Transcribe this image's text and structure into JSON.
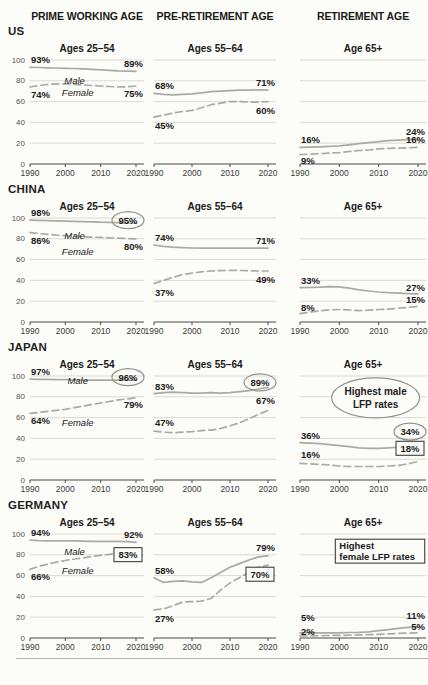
{
  "header": {
    "columns": [
      "PRIME WORKING AGE",
      "PRE-RETIREMENT AGE",
      "RETIREMENT AGE"
    ]
  },
  "rows": [
    {
      "label": "US"
    },
    {
      "label": "CHINA"
    },
    {
      "label": "JAPAN"
    },
    {
      "label": "GERMANY"
    }
  ],
  "axis": {
    "x_ticks": [
      "1990",
      "2000",
      "2010",
      "2020"
    ],
    "x_years": [
      1990,
      2020
    ],
    "y_ticks": [
      "100",
      "80",
      "60",
      "40",
      "20",
      "0"
    ],
    "ylim": [
      0,
      100
    ],
    "grid": true
  },
  "colors": {
    "line": "#a9aca2",
    "grid": "#dbdbd3",
    "axis": "#4a4a44",
    "text": "#1b1b19",
    "tick_text": "#3b3b36",
    "ytick_text": "#55534e",
    "annotation_stroke": "#8f9288",
    "box_stroke": "#2c2c28",
    "background": "#fcfcf9"
  },
  "chart_data": [
    {
      "id": "us-25-54",
      "country": "US",
      "title": "Ages 25–54",
      "type": "line",
      "col": 0,
      "show_y_axis": true,
      "ylim": [
        0,
        100
      ],
      "series": [
        {
          "name": "Male",
          "style": "solid",
          "start_label": "93%",
          "end_label": "89%",
          "start_dy": -4,
          "end_dy": -4,
          "end_decoration": null,
          "name_label": {
            "x": 0.42,
            "dy": 9
          },
          "values": [
            93,
            92.8,
            92.5,
            92.3,
            92,
            91.8,
            91.5,
            91,
            90.5,
            90,
            89.5,
            89.2,
            89
          ]
        },
        {
          "name": "Female",
          "style": "dashed",
          "start_label": "74%",
          "end_label": "75%",
          "start_dy": 11,
          "end_dy": 11,
          "end_decoration": null,
          "name_label": {
            "x": 0.45,
            "dy": 6
          },
          "values": [
            74,
            75.5,
            76.5,
            77,
            77,
            76.5,
            76,
            75.5,
            75,
            74.5,
            74,
            74.3,
            75
          ]
        }
      ],
      "callout": null
    },
    {
      "id": "us-55-64",
      "country": "US",
      "title": "Ages 55–64",
      "type": "line",
      "col": 1,
      "show_y_axis": false,
      "ylim": [
        0,
        100
      ],
      "series": [
        {
          "name": "Male",
          "style": "solid",
          "start_label": "68%",
          "end_label": "71%",
          "start_dy": -4,
          "end_dy": -4,
          "end_decoration": null,
          "name_label": null,
          "values": [
            68,
            67,
            66.5,
            67,
            67.5,
            68.5,
            69.5,
            70,
            70.5,
            71,
            71,
            71.3,
            71
          ]
        },
        {
          "name": "Female",
          "style": "dashed",
          "start_label": "45%",
          "end_label": "60%",
          "start_dy": 12,
          "end_dy": 12,
          "end_decoration": null,
          "name_label": null,
          "values": [
            45,
            47,
            49,
            50.5,
            51.5,
            54,
            57,
            58.5,
            60,
            60,
            59.5,
            59.5,
            60
          ]
        }
      ],
      "callout": null
    },
    {
      "id": "us-65",
      "country": "US",
      "title": "Age 65+",
      "type": "line",
      "col": 2,
      "show_y_axis": false,
      "ylim": [
        0,
        100
      ],
      "series": [
        {
          "name": "Male",
          "style": "solid",
          "start_label": "16%",
          "end_label": "24%",
          "start_dy": -4,
          "end_dy": -4,
          "end_decoration": null,
          "name_label": null,
          "values": [
            16,
            16.2,
            16.5,
            17,
            17.5,
            18.5,
            19.5,
            20.5,
            21.5,
            22.5,
            23,
            23.5,
            24
          ]
        },
        {
          "name": "Female",
          "style": "dashed",
          "start_label": "9%",
          "end_label": "16%",
          "start_dy": 9,
          "end_dy": -4,
          "end_decoration": null,
          "name_label": null,
          "values": [
            9,
            9.5,
            10,
            10.5,
            11,
            12,
            13,
            13.5,
            14.5,
            15,
            15.3,
            15.6,
            16
          ]
        }
      ],
      "callout": null
    },
    {
      "id": "china-25-54",
      "country": "CHINA",
      "title": "Ages 25–54",
      "type": "line",
      "col": 0,
      "show_y_axis": true,
      "ylim": [
        0,
        100
      ],
      "series": [
        {
          "name": "Male",
          "style": "solid",
          "start_label": "98%",
          "end_label": "95%",
          "start_dy": -4,
          "end_dy": -3,
          "end_decoration": "circle",
          "name_label": {
            "x": 0.42,
            "dy": 12
          },
          "values": [
            98,
            97.8,
            97.5,
            97.2,
            97,
            96.8,
            96.5,
            96.3,
            96,
            95.8,
            95.5,
            95.2,
            95
          ]
        },
        {
          "name": "Female",
          "style": "dashed",
          "start_label": "86%",
          "end_label": "80%",
          "start_dy": 11,
          "end_dy": 11,
          "end_decoration": null,
          "name_label": {
            "x": 0.45,
            "dy": 13
          },
          "values": [
            86,
            85,
            84.3,
            83.6,
            83,
            82.5,
            82,
            81.6,
            81.3,
            81,
            80.6,
            80.3,
            80
          ]
        }
      ],
      "callout": null
    },
    {
      "id": "china-55-64",
      "country": "CHINA",
      "title": "Ages 55–64",
      "type": "line",
      "col": 1,
      "show_y_axis": false,
      "ylim": [
        0,
        100
      ],
      "series": [
        {
          "name": "Male",
          "style": "solid",
          "start_label": "74%",
          "end_label": "71%",
          "start_dy": -4,
          "end_dy": -4,
          "end_decoration": null,
          "name_label": null,
          "values": [
            74,
            72.8,
            72,
            71.5,
            71.2,
            71,
            71,
            71,
            71,
            71,
            71,
            71,
            71
          ]
        },
        {
          "name": "Female",
          "style": "dashed",
          "start_label": "37%",
          "end_label": "49%",
          "start_dy": 12,
          "end_dy": 12,
          "end_decoration": null,
          "name_label": null,
          "values": [
            37,
            40,
            43,
            45.5,
            47,
            48.3,
            49,
            49.4,
            49.6,
            49.5,
            49.3,
            49,
            49
          ]
        }
      ],
      "callout": null
    },
    {
      "id": "china-65",
      "country": "CHINA",
      "title": "Age 65+",
      "type": "line",
      "col": 2,
      "show_y_axis": false,
      "ylim": [
        0,
        100
      ],
      "series": [
        {
          "name": "Male",
          "style": "solid",
          "start_label": "33%",
          "end_label": "27%",
          "start_dy": -4,
          "end_dy": -3,
          "end_decoration": null,
          "name_label": null,
          "values": [
            33,
            33.2,
            33.5,
            34,
            33.8,
            32.5,
            31,
            29.8,
            28.8,
            28.2,
            27.8,
            27.3,
            27
          ]
        },
        {
          "name": "Female",
          "style": "dashed",
          "start_label": "8%",
          "end_label": "15%",
          "start_dy": -3,
          "end_dy": -3,
          "end_decoration": null,
          "name_label": null,
          "values": [
            8,
            9.5,
            10.8,
            11.6,
            12,
            11.5,
            11,
            11.3,
            12,
            12.4,
            13.2,
            14,
            15
          ]
        }
      ],
      "callout": null
    },
    {
      "id": "japan-25-54",
      "country": "JAPAN",
      "title": "Ages 25–54",
      "type": "line",
      "col": 0,
      "show_y_axis": true,
      "ylim": [
        0,
        100
      ],
      "series": [
        {
          "name": "Male",
          "style": "solid",
          "start_label": "97%",
          "end_label": "96%",
          "start_dy": -4,
          "end_dy": -3,
          "end_decoration": "circle",
          "name_label": {
            "x": 0.45,
            "dy": -2
          },
          "values": [
            97,
            96.8,
            96.7,
            96.5,
            96.4,
            96.2,
            96.1,
            96,
            96,
            96,
            96,
            96,
            96
          ]
        },
        {
          "name": "Female",
          "style": "dashed",
          "start_label": "64%",
          "end_label": "79%",
          "start_dy": 11,
          "end_dy": 10,
          "end_decoration": null,
          "name_label": {
            "x": 0.45,
            "dy": 12
          },
          "values": [
            64,
            65,
            66,
            67,
            68,
            69.5,
            71,
            72.5,
            74,
            75.5,
            77,
            78,
            79
          ]
        }
      ],
      "callout": null
    },
    {
      "id": "japan-55-64",
      "country": "JAPAN",
      "title": "Ages 55–64",
      "type": "line",
      "col": 1,
      "show_y_axis": false,
      "ylim": [
        0,
        100
      ],
      "series": [
        {
          "name": "Male",
          "style": "solid",
          "start_label": "83%",
          "end_label": "89%",
          "start_dy": -4,
          "end_dy": -5,
          "end_decoration": "circle",
          "name_label": null,
          "values": [
            83,
            84,
            84.5,
            84,
            83.5,
            83.5,
            84,
            83.5,
            84,
            85,
            86,
            87.5,
            89
          ]
        },
        {
          "name": "Female",
          "style": "dashed",
          "start_label": "47%",
          "end_label": "67%",
          "start_dy": -5,
          "end_dy": -6,
          "end_decoration": null,
          "name_label": null,
          "values": [
            47,
            46,
            45.5,
            46,
            46.5,
            47.5,
            48,
            49.5,
            52,
            55,
            59,
            63,
            67
          ]
        }
      ],
      "callout": null
    },
    {
      "id": "japan-65",
      "country": "JAPAN",
      "title": "Age 65+",
      "type": "line",
      "col": 2,
      "show_y_axis": false,
      "ylim": [
        0,
        100
      ],
      "series": [
        {
          "name": "Male",
          "style": "solid",
          "start_label": "36%",
          "end_label": "34%",
          "start_dy": -4,
          "end_dy": -13,
          "end_decoration": "circle",
          "name_label": null,
          "values": [
            36,
            35.5,
            35,
            34,
            33,
            32,
            31,
            30.5,
            30.5,
            31,
            31.5,
            32.5,
            34
          ]
        },
        {
          "name": "Female",
          "style": "dashed",
          "start_label": "16%",
          "end_label": "18%",
          "start_dy": -5,
          "end_dy": -13,
          "end_decoration": "box",
          "name_label": null,
          "values": [
            16,
            15.5,
            15,
            14.5,
            13.5,
            13,
            13,
            13,
            13,
            13.5,
            14,
            15.5,
            18
          ]
        }
      ],
      "callout": {
        "shape": "ellipse",
        "lines": [
          "Highest male",
          "LFP rates"
        ],
        "cx": 0.6,
        "cy": 0.21,
        "rx": 44,
        "ry": 20
      }
    },
    {
      "id": "germany-25-54",
      "country": "GERMANY",
      "title": "Ages 25–54",
      "type": "line",
      "col": 0,
      "show_y_axis": true,
      "ylim": [
        0,
        100
      ],
      "series": [
        {
          "name": "Male",
          "style": "solid",
          "start_label": "94%",
          "end_label": "92%",
          "start_dy": -4,
          "end_dy": -4,
          "end_decoration": null,
          "name_label": {
            "x": 0.42,
            "dy": 8
          },
          "values": [
            94,
            93.6,
            93.5,
            93.5,
            93.5,
            93.4,
            93.2,
            93,
            93,
            93,
            93,
            92.6,
            92
          ]
        },
        {
          "name": "Female",
          "style": "dashed",
          "start_label": "66%",
          "end_label": "83%",
          "start_dy": 11,
          "end_dy": 3,
          "end_decoration": "box",
          "name_label": {
            "x": 0.45,
            "dy": 9
          },
          "values": [
            66,
            69,
            71,
            73,
            74.5,
            76,
            77,
            78.5,
            79.5,
            80.5,
            81.5,
            82.3,
            83
          ]
        }
      ],
      "callout": null
    },
    {
      "id": "germany-55-64",
      "country": "GERMANY",
      "title": "Ages 55–64",
      "type": "line",
      "col": 1,
      "show_y_axis": false,
      "ylim": [
        0,
        100
      ],
      "series": [
        {
          "name": "Male",
          "style": "solid",
          "start_label": "58%",
          "end_label": "79%",
          "start_dy": -4,
          "end_dy": -5,
          "end_decoration": null,
          "name_label": null,
          "values": [
            58,
            53.5,
            54.5,
            55,
            54,
            53.5,
            58,
            63,
            68,
            71.5,
            75,
            78,
            79
          ]
        },
        {
          "name": "Female",
          "style": "dashed",
          "start_label": "27%",
          "end_label": "70%",
          "start_dy": 12,
          "end_dy": 9,
          "end_decoration": "box",
          "name_label": null,
          "values": [
            27,
            28,
            31,
            34.5,
            35,
            35.5,
            38,
            46,
            53,
            58,
            63,
            68,
            70
          ]
        }
      ],
      "callout": null
    },
    {
      "id": "germany-65",
      "country": "GERMANY",
      "title": "Age 65+",
      "type": "line",
      "col": 2,
      "show_y_axis": false,
      "ylim": [
        0,
        100
      ],
      "series": [
        {
          "name": "Male",
          "style": "solid",
          "start_label": "5%",
          "end_label": "11%",
          "start_dy": -12,
          "end_dy": -8,
          "end_decoration": null,
          "name_label": null,
          "values": [
            5,
            5,
            5,
            5,
            5,
            5.3,
            5.5,
            6,
            7,
            8,
            9.3,
            10.3,
            11
          ]
        },
        {
          "name": "Female",
          "style": "dashed",
          "start_label": "2%",
          "end_label": "5%",
          "start_dy": -1,
          "end_dy": -3,
          "end_decoration": null,
          "name_label": null,
          "values": [
            2,
            2,
            2.2,
            2.4,
            2.5,
            2.7,
            3,
            3.2,
            3.5,
            4,
            4.4,
            4.7,
            5
          ]
        }
      ],
      "callout": {
        "shape": "box",
        "lines": [
          "Highest",
          "female LFP rates"
        ],
        "x": 0.28,
        "y": 0.05,
        "w": 0.71,
        "h": 0.23
      }
    }
  ]
}
